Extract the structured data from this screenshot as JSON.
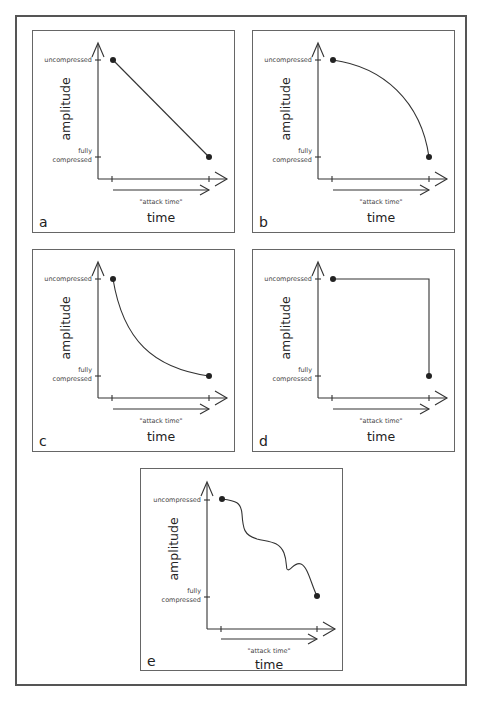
{
  "figure": {
    "panels": [
      {
        "letter": "a",
        "shape": "linear",
        "y_label": "amplitude",
        "x_label": "time",
        "y_tick_top": "uncompressed",
        "y_tick_bottom_1": "fully",
        "y_tick_bottom_2": "compressed",
        "attack_label": "\"attack time\""
      },
      {
        "letter": "b",
        "shape": "convex (slow then fast)",
        "y_label": "amplitude",
        "x_label": "time",
        "y_tick_top": "uncompressed",
        "y_tick_bottom_1": "fully",
        "y_tick_bottom_2": "compressed",
        "attack_label": "\"attack time\""
      },
      {
        "letter": "c",
        "shape": "exponential decay (fast then slow)",
        "y_label": "amplitude",
        "x_label": "time",
        "y_tick_top": "uncompressed",
        "y_tick_bottom_1": "fully",
        "y_tick_bottom_2": "compressed",
        "attack_label": "\"attack time\""
      },
      {
        "letter": "d",
        "shape": "step (hold then instant drop)",
        "y_label": "amplitude",
        "x_label": "time",
        "y_tick_top": "uncompressed",
        "y_tick_bottom_1": "fully",
        "y_tick_bottom_2": "compressed",
        "attack_label": "\"attack time\""
      },
      {
        "letter": "e",
        "shape": "irregular wavy descent",
        "y_label": "amplitude",
        "x_label": "time",
        "y_tick_top": "uncompressed",
        "y_tick_bottom_1": "fully",
        "y_tick_bottom_2": "compressed",
        "attack_label": "\"attack time\""
      }
    ],
    "colors": {
      "line": "#333333",
      "border": "#666666",
      "text": "#222222"
    }
  }
}
